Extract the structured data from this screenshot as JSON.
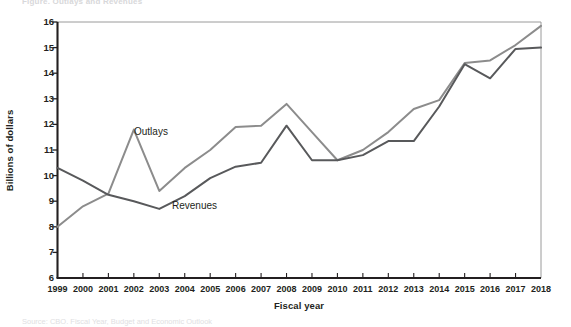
{
  "figure": {
    "clipped_title": "Figure. Outlays and Revenues",
    "clipped_source": "Source: CBO. Fiscal Year, Budget and Economic Outlook"
  },
  "axes": {
    "ylabel": "Billions of dollars",
    "xlabel": "Fiscal year",
    "yticks": [
      6,
      7,
      8,
      9,
      10,
      11,
      12,
      13,
      14,
      15,
      16
    ],
    "xticks": [
      "1999",
      "2000",
      "2001",
      "2002",
      "2003",
      "2004",
      "2005",
      "2006",
      "2007",
      "2008",
      "2009",
      "2010",
      "2011",
      "2012",
      "2013",
      "2014",
      "2015",
      "2016",
      "2017",
      "2018"
    ]
  },
  "annotations": {
    "outlays_label": "Outlays",
    "revenues_label": "Revenues"
  },
  "colors": {
    "outlays_line": "#8c8c8c",
    "revenues_line": "#58595b",
    "axis": "#231f20",
    "tick": "#231f20",
    "background": "#ffffff"
  },
  "chart_data": {
    "type": "line",
    "title": "",
    "xlabel": "Fiscal year",
    "ylabel": "Billions of dollars",
    "ylim": [
      6,
      16
    ],
    "xlim": [
      "1999",
      "2018"
    ],
    "grid": false,
    "legend": "inline-annotation",
    "x": [
      1999,
      2000,
      2001,
      2002,
      2003,
      2004,
      2005,
      2006,
      2007,
      2008,
      2009,
      2010,
      2011,
      2012,
      2013,
      2014,
      2015,
      2016,
      2017,
      2018
    ],
    "series": [
      {
        "name": "Outlays",
        "color": "#8c8c8c",
        "values": [
          8.0,
          8.8,
          9.3,
          11.8,
          9.4,
          10.3,
          11.0,
          11.9,
          11.95,
          12.8,
          11.7,
          10.6,
          11.0,
          11.7,
          12.6,
          12.95,
          14.4,
          14.5,
          15.1,
          15.85
        ]
      },
      {
        "name": "Revenues",
        "color": "#58595b",
        "values": [
          10.3,
          9.8,
          9.25,
          9.0,
          8.7,
          9.2,
          9.9,
          10.35,
          10.5,
          11.95,
          10.6,
          10.6,
          10.8,
          11.35,
          11.35,
          12.7,
          14.35,
          13.8,
          14.95,
          15.0
        ]
      }
    ]
  }
}
